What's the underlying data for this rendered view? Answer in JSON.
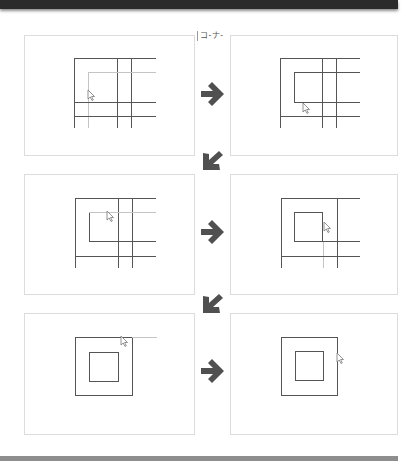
{
  "header": {
    "bar_color": "#2b2b2b"
  },
  "footer": {
    "bar_color": "#8e8e8e"
  },
  "step_label": "コ-ナ-",
  "colors": {
    "line_dark": "#555555",
    "line_light": "#c4c4c4",
    "arrow": "#505050",
    "panel_border": "#dcdcdc"
  },
  "panels": [
    {
      "id": 1,
      "caption": "Initial grid with inner corner lines; cursor near inner left line"
    },
    {
      "id": 2,
      "caption": "Inner rectangle left/bottom segments trimmed; cursor at inner corner"
    },
    {
      "id": 3,
      "caption": "Grid with inner rectangle; cursor at inner top edge"
    },
    {
      "id": 4,
      "caption": "Inner square closed; cursor at right edge of inner square"
    },
    {
      "id": 5,
      "caption": "Outer square and inner square; cursor at top-right corner"
    },
    {
      "id": 6,
      "caption": "Final nested squares; cursor at outer right edge"
    }
  ],
  "arrows": [
    {
      "from": 1,
      "to": 2,
      "direction": "right"
    },
    {
      "from": 2,
      "to": 3,
      "direction": "down-left"
    },
    {
      "from": 3,
      "to": 4,
      "direction": "right"
    },
    {
      "from": 4,
      "to": 5,
      "direction": "down-left"
    },
    {
      "from": 5,
      "to": 6,
      "direction": "right"
    }
  ]
}
